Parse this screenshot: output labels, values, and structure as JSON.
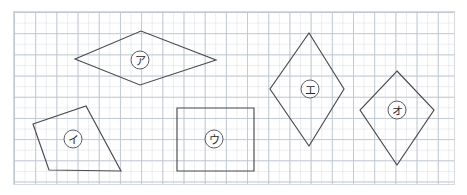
{
  "page": {
    "width": 467,
    "height": 195,
    "background_color": "#ffffff"
  },
  "grid": {
    "frame_color": "#d6d9dd",
    "major_line_color": "#aab6c4",
    "minor_line_color": "#c4cdd6",
    "major_spacing_px": 21.2,
    "minor_spacing_px": 10.6,
    "frame": {
      "x": 13,
      "y": 11,
      "width": 442,
      "height": 174
    }
  },
  "style": {
    "shape_stroke_color": "#4a4a52",
    "label_text_color": "#2b2b30",
    "label_circle_fill": "#ffffff"
  },
  "shapes": [
    {
      "id": "shape-a",
      "label": "ア",
      "kind": "rhombus",
      "points": "75,59 141,31 216,60 140,85",
      "label_x": 140,
      "label_y": 60,
      "label_r": 9
    },
    {
      "id": "shape-i",
      "label": "イ",
      "kind": "irregular-quadrilateral",
      "points": "33,124 86,106 121,171 49,170",
      "label_x": 73,
      "label_y": 139,
      "label_r": 9
    },
    {
      "id": "shape-u",
      "label": "ウ",
      "kind": "rectangle",
      "points": "177,108 254,108 254,171 177,171",
      "label_x": 214,
      "label_y": 139,
      "label_r": 9
    },
    {
      "id": "shape-e",
      "label": "エ",
      "kind": "rhombus",
      "points": "309,33 344,89 309,146 270,89",
      "label_x": 310,
      "label_y": 89,
      "label_r": 9
    },
    {
      "id": "shape-o",
      "label": "オ",
      "kind": "rhombus",
      "points": "397,71 434,110 397,165 360,110",
      "label_x": 397,
      "label_y": 110,
      "label_r": 9
    }
  ]
}
